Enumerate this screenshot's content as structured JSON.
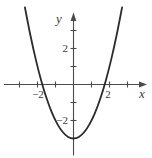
{
  "figure": {
    "x_axis_label": "x",
    "y_axis_label": "y",
    "x_tick_labels": {
      "neg2": "−2",
      "pos2": "2"
    },
    "y_tick_labels": {
      "neg2": "−2",
      "pos2": "2"
    }
  },
  "chart_data": {
    "type": "line",
    "title": "",
    "xlabel": "x",
    "ylabel": "y",
    "xlim": [
      -3.85,
      4.1
    ],
    "ylim": [
      -4.1,
      4.7
    ],
    "xticks": [
      -3,
      -2,
      -1,
      1,
      2,
      3
    ],
    "yticks": [
      -2,
      -1,
      1,
      2,
      3
    ],
    "x_labeled_ticks": [
      -2,
      2
    ],
    "y_labeled_ticks": [
      -2,
      2
    ],
    "grid": false,
    "legend": false,
    "series": [
      {
        "name": "y = x² − 3",
        "x": [
          -2.7,
          -2.4,
          -2.1,
          -1.8,
          -1.5,
          -1.2,
          -0.9,
          -0.6,
          -0.3,
          0,
          0.3,
          0.6,
          0.9,
          1.2,
          1.5,
          1.8,
          2.1,
          2.4,
          2.7
        ],
        "y": [
          4.29,
          2.76,
          1.41,
          0.24,
          -0.75,
          -1.56,
          -2.19,
          -2.64,
          -2.91,
          -3,
          -2.91,
          -2.64,
          -2.19,
          -1.56,
          -0.75,
          0.24,
          1.41,
          2.76,
          4.29
        ]
      }
    ]
  },
  "colors": {
    "curve": "#2b2b2b",
    "axis": "#4a4a4a",
    "text": "#3c3c3c",
    "background": "#ffffff"
  }
}
